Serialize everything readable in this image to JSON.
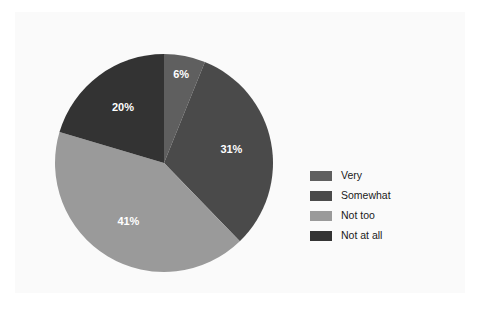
{
  "chart_data": {
    "type": "pie",
    "title": "",
    "subtitle": "",
    "xlabel": "",
    "ylabel": "",
    "categories": [
      "Very",
      "Somewhat",
      "Not too",
      "Not at all"
    ],
    "values": [
      6,
      31,
      41,
      20
    ],
    "value_labels": [
      "6%",
      "31%",
      "41%",
      "20%"
    ],
    "colors": [
      "#5f5f5f",
      "#4a4a4a",
      "#9a9a9a",
      "#333333"
    ],
    "start_angle_deg": 0,
    "direction": "clockwise",
    "label_text_color": "#ffffff",
    "legend_position": "right",
    "grid": false,
    "background": "#fafafa",
    "slices": [
      {
        "label": "Very",
        "value": 6,
        "display": "6%",
        "color": "#5f5f5f"
      },
      {
        "label": "Somewhat",
        "value": 31,
        "display": "31%",
        "color": "#4a4a4a"
      },
      {
        "label": "Not too",
        "value": 41,
        "display": "41%",
        "color": "#9a9a9a"
      },
      {
        "label": "Not at all",
        "value": 20,
        "display": "20%",
        "color": "#333333"
      }
    ]
  },
  "legend": {
    "items": [
      {
        "label": "Very",
        "color": "#5f5f5f"
      },
      {
        "label": "Somewhat",
        "color": "#4a4a4a"
      },
      {
        "label": "Not too",
        "color": "#9a9a9a"
      },
      {
        "label": "Not at all",
        "color": "#333333"
      }
    ]
  }
}
